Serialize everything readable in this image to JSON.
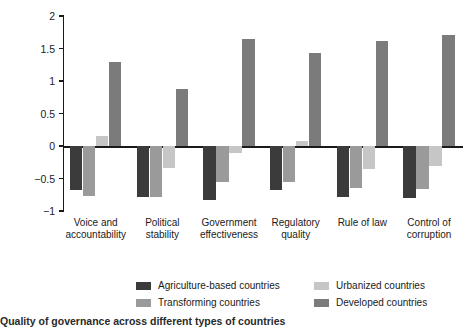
{
  "chart_data": {
    "type": "bar",
    "title": "",
    "subtitle": "",
    "xlabel": "",
    "ylabel": "Governance score",
    "ylim": [
      -1,
      2
    ],
    "yticks": [
      -1,
      -0.5,
      0,
      0.5,
      1,
      1.5,
      2
    ],
    "ytick_labels": [
      "−1",
      "−0.5",
      "0",
      "0.5",
      "1",
      "1.5",
      "2"
    ],
    "grid": false,
    "legend_position": "bottom",
    "categories": [
      "Voice and\naccountability",
      "Political\nstability",
      "Government\neffectiveness",
      "Regulatory\nquality",
      "Rule of law",
      "Control of\ncorruption"
    ],
    "series": [
      {
        "name": "Agriculture-based countries",
        "color": "#3b3b3b",
        "values": [
          -0.67,
          -0.79,
          -0.83,
          -0.67,
          -0.79,
          -0.8
        ]
      },
      {
        "name": "Transforming countries",
        "color": "#9a9a9a",
        "values": [
          -0.77,
          -0.79,
          -0.56,
          -0.55,
          -0.64,
          -0.66
        ]
      },
      {
        "name": "Urbanized countries",
        "color": "#c6c6c6",
        "values": [
          0.15,
          -0.34,
          -0.1,
          0.08,
          -0.36,
          -0.3
        ]
      },
      {
        "name": "Developed countries",
        "color": "#7b7b7b",
        "values": [
          1.29,
          0.87,
          1.65,
          1.43,
          1.62,
          1.71
        ]
      }
    ]
  },
  "legend": {
    "entries": [
      {
        "label": "Agriculture-based countries",
        "color": "#3b3b3b"
      },
      {
        "label": "Urbanized countries",
        "color": "#c6c6c6"
      },
      {
        "label": "Transforming countries",
        "color": "#9a9a9a"
      },
      {
        "label": "Developed countries",
        "color": "#7b7b7b"
      }
    ]
  },
  "caption": {
    "text": "  Quality of governance across different types of countries"
  }
}
